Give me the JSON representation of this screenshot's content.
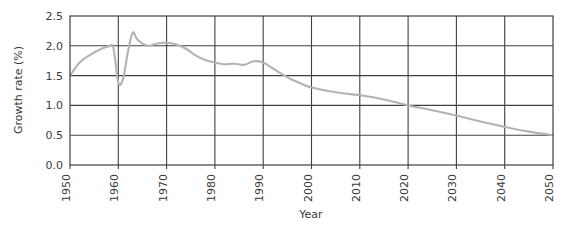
{
  "chart_data": {
    "type": "line",
    "title": "",
    "xlabel": "Year",
    "ylabel": "Growth rate (%)",
    "xlim": [
      1950,
      2050
    ],
    "ylim": [
      0.0,
      2.5
    ],
    "xticks": [
      "1950",
      "1960",
      "1970",
      "1980",
      "1990",
      "2000",
      "2010",
      "2020",
      "2030",
      "2040",
      "2050"
    ],
    "yticks": [
      "0.0",
      "0.5",
      "1.0",
      "1.5",
      "2.0",
      "2.5"
    ],
    "grid": "both",
    "legend": "none",
    "line_color": "#b3b3b3",
    "grid_color": "#404040",
    "series": [
      {
        "name": "World population growth rate",
        "x": [
          1950,
          1952,
          1954,
          1956,
          1958,
          1959,
          1960,
          1961,
          1962,
          1963,
          1964,
          1966,
          1968,
          1970,
          1972,
          1974,
          1976,
          1978,
          1980,
          1982,
          1984,
          1986,
          1988,
          1990,
          1992,
          1994,
          1996,
          1998,
          2000,
          2005,
          2010,
          2015,
          2020,
          2025,
          2030,
          2035,
          2040,
          2045,
          2050
        ],
        "y": [
          1.5,
          1.72,
          1.84,
          1.93,
          1.99,
          1.96,
          1.38,
          1.45,
          1.9,
          2.22,
          2.1,
          2.0,
          2.04,
          2.05,
          2.02,
          1.95,
          1.84,
          1.76,
          1.72,
          1.69,
          1.7,
          1.68,
          1.74,
          1.72,
          1.62,
          1.52,
          1.43,
          1.36,
          1.3,
          1.22,
          1.17,
          1.1,
          1.0,
          0.92,
          0.83,
          0.73,
          0.64,
          0.56,
          0.5
        ]
      }
    ]
  }
}
